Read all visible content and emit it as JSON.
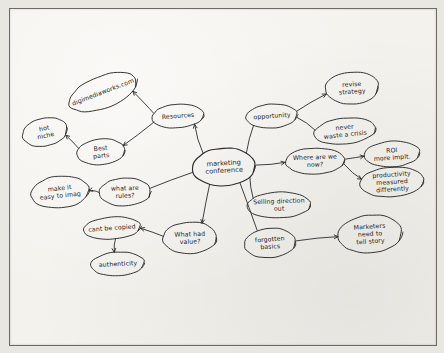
{
  "document": {
    "type": "hand-drawn-mind-map",
    "medium": "ink on paper photograph",
    "paper_color": "#f4f2ed",
    "ink_color": "#2b2b2b",
    "background_color": "#8d8d8d"
  },
  "chart_data": {
    "type": "diagram",
    "center": "marketing conference",
    "node_count": 18,
    "nodes": [
      {
        "id": "center",
        "label": "marketing conference",
        "lines": [
          "marketing",
          "conference"
        ],
        "cx": 224,
        "cy": 167,
        "rx": 32,
        "ry": 19,
        "rot": -3
      },
      {
        "id": "resources",
        "label": "Resources",
        "lines": [
          "Resources"
        ],
        "cx": 178,
        "cy": 116,
        "rx": 26,
        "ry": 12,
        "rot": -4
      },
      {
        "id": "digimedia",
        "label": "digimediaworks.com",
        "lines": [
          "digimediaworks.com"
        ],
        "cx": 103,
        "cy": 92,
        "rx": 36,
        "ry": 16,
        "rot": -21
      },
      {
        "id": "hotniche",
        "label": "hot niche",
        "lines": [
          "hot",
          "niche"
        ],
        "cx": 45,
        "cy": 132,
        "rx": 23,
        "ry": 14,
        "rot": -12
      },
      {
        "id": "bestparts",
        "label": "Best parts",
        "lines": [
          "Best",
          "parts"
        ],
        "cx": 101,
        "cy": 152,
        "rx": 24,
        "ry": 13,
        "rot": -5
      },
      {
        "id": "makeiteasy",
        "label": "make it easy to imagine",
        "lines": [
          "make it",
          "easy to imag"
        ],
        "cx": 60,
        "cy": 192,
        "rx": 29,
        "ry": 16,
        "rot": -6
      },
      {
        "id": "whatrules",
        "label": "what are rules?",
        "lines": [
          "what are",
          "rules?"
        ],
        "cx": 125,
        "cy": 192,
        "rx": 26,
        "ry": 14,
        "rot": -2
      },
      {
        "id": "cantcopy",
        "label": "cant be copied",
        "lines": [
          "cant be copied"
        ],
        "cx": 112,
        "cy": 228,
        "rx": 29,
        "ry": 11,
        "rot": -4
      },
      {
        "id": "authenticity",
        "label": "authenticity",
        "lines": [
          "authenticity"
        ],
        "cx": 118,
        "cy": 264,
        "rx": 27,
        "ry": 12,
        "rot": -3
      },
      {
        "id": "whatvalue",
        "label": "What had value?",
        "lines": [
          "What had",
          "value?"
        ],
        "cx": 190,
        "cy": 238,
        "rx": 27,
        "ry": 16,
        "rot": -2
      },
      {
        "id": "opportunity",
        "label": "opportunity",
        "lines": [
          "opportunity"
        ],
        "cx": 272,
        "cy": 116,
        "rx": 26,
        "ry": 12,
        "rot": -4
      },
      {
        "id": "revise",
        "label": "revise strategy",
        "lines": [
          "revise",
          "strategy"
        ],
        "cx": 352,
        "cy": 88,
        "rx": 27,
        "ry": 16,
        "rot": -4
      },
      {
        "id": "nevercrisis",
        "label": "never waste a crisis",
        "lines": [
          "never",
          "waste a crisis"
        ],
        "cx": 345,
        "cy": 131,
        "rx": 31,
        "ry": 13,
        "rot": -6
      },
      {
        "id": "wherenow",
        "label": "Where are we now?",
        "lines": [
          "Where are we",
          "now?"
        ],
        "cx": 315,
        "cy": 161,
        "rx": 30,
        "ry": 13,
        "rot": -2
      },
      {
        "id": "roi",
        "label": "ROI more implt.",
        "lines": [
          "ROI",
          "more implt."
        ],
        "cx": 392,
        "cy": 154,
        "rx": 28,
        "ry": 13,
        "rot": -4
      },
      {
        "id": "productivity",
        "label": "productivity measured differently",
        "lines": [
          "productivity",
          "measured",
          "differently"
        ],
        "cx": 392,
        "cy": 182,
        "rx": 32,
        "ry": 15,
        "rot": -4
      },
      {
        "id": "selling",
        "label": "Selling direction out",
        "lines": [
          "Selling direction",
          "out"
        ],
        "cx": 279,
        "cy": 205,
        "rx": 32,
        "ry": 13,
        "rot": -2
      },
      {
        "id": "forgotten",
        "label": "forgotten basics",
        "lines": [
          "forgotten",
          "basics"
        ],
        "cx": 270,
        "cy": 243,
        "rx": 26,
        "ry": 15,
        "rot": -4
      },
      {
        "id": "marketers",
        "label": "Marketers need to tell story",
        "lines": [
          "Marketers",
          "need to",
          "tell story"
        ],
        "cx": 370,
        "cy": 234,
        "rx": 32,
        "ry": 19,
        "rot": -4
      }
    ],
    "edges": [
      {
        "from": "center",
        "to": "resources",
        "arrow": true
      },
      {
        "from": "resources",
        "to": "digimedia",
        "arrow": true
      },
      {
        "from": "resources",
        "to": "bestparts",
        "arrow": true
      },
      {
        "from": "bestparts",
        "to": "hotniche",
        "arrow": true
      },
      {
        "from": "center",
        "to": "whatrules",
        "arrow": false
      },
      {
        "from": "whatrules",
        "to": "makeiteasy",
        "arrow": true
      },
      {
        "from": "center",
        "to": "whatvalue",
        "arrow": true
      },
      {
        "from": "whatvalue",
        "to": "cantcopy",
        "arrow": true
      },
      {
        "from": "cantcopy",
        "to": "authenticity",
        "arrow": true
      },
      {
        "from": "center",
        "to": "opportunity",
        "arrow": false
      },
      {
        "from": "opportunity",
        "to": "revise",
        "arrow": true
      },
      {
        "from": "opportunity",
        "to": "nevercrisis",
        "arrow": false
      },
      {
        "from": "center",
        "to": "wherenow",
        "arrow": true
      },
      {
        "from": "wherenow",
        "to": "roi",
        "arrow": true
      },
      {
        "from": "wherenow",
        "to": "productivity",
        "arrow": true
      },
      {
        "from": "center",
        "to": "selling",
        "arrow": false
      },
      {
        "from": "center",
        "to": "forgotten",
        "arrow": false
      },
      {
        "from": "forgotten",
        "to": "marketers",
        "arrow": true
      }
    ]
  }
}
